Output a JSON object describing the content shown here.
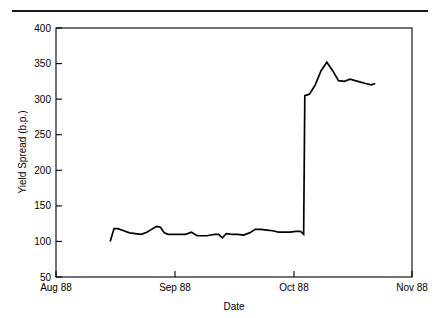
{
  "figure": {
    "background_color": "#ffffff",
    "line_color": "#000000",
    "rule_color": "#1a1a1a"
  },
  "chart_data": {
    "type": "line",
    "title": "",
    "subtitle": "",
    "xlabel": "Date",
    "ylabel": "Yield Spread (b.p.)",
    "xlim": [
      0,
      92
    ],
    "ylim": [
      50,
      400
    ],
    "grid": false,
    "legend": false,
    "legend_position": "none",
    "x_tick_labels": [
      "Aug 88",
      "Sep 88",
      "Oct 88",
      "Nov 88"
    ],
    "x_tick_values": [
      0,
      31,
      61,
      92
    ],
    "y_tick_labels": [
      "50",
      "100",
      "150",
      "200",
      "250",
      "300",
      "350",
      "400"
    ],
    "y_tick_values": [
      50,
      100,
      150,
      200,
      250,
      300,
      350,
      400
    ],
    "series": [
      {
        "name": "Yield Spread",
        "color": "#000000",
        "x": [
          14.0,
          15.0,
          16.0,
          17.5,
          19.0,
          20.5,
          22.0,
          23.5,
          25.0,
          26.0,
          27.0,
          28.0,
          29.0,
          30.5,
          32.0,
          33.5,
          35.0,
          36.5,
          38.0,
          39.0,
          40.0,
          41.0,
          42.0,
          43.0,
          44.0,
          45.5,
          47.0,
          48.5,
          50.0,
          51.5,
          53.0,
          54.5,
          56.0,
          57.5,
          59.0,
          60.5,
          62.0,
          63.2,
          64.0,
          64.3,
          65.5,
          67.0,
          68.5,
          70.0,
          71.5,
          73.0,
          74.5,
          76.0,
          78.0,
          80.0,
          81.5,
          82.5
        ],
        "y": [
          100,
          118,
          118,
          115,
          112,
          111,
          110,
          113,
          118,
          121,
          120,
          112,
          110,
          110,
          110,
          110,
          113,
          108,
          108,
          108,
          109,
          110,
          110,
          105,
          111,
          110,
          110,
          109,
          112,
          117,
          117,
          116,
          115,
          113,
          113,
          113,
          114,
          114,
          110,
          305,
          307,
          320,
          340,
          352,
          340,
          326,
          325,
          328,
          325,
          322,
          320,
          322
        ]
      }
    ],
    "annotations": [
      {
        "text": "Sharp spike in early October 1988 from ~110 b.p. to ~305 b.p.",
        "x": 64,
        "y": 305
      }
    ]
  },
  "axes": {
    "x_axis_name": "date-axis",
    "y_axis_name": "yield-spread-axis"
  }
}
